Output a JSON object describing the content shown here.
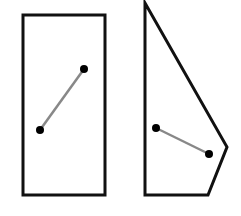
{
  "canvas": {
    "width": 241,
    "height": 216,
    "background": "#ffffff"
  },
  "colors": {
    "outline": "#111111",
    "segment": "#888888",
    "point": "#000000"
  },
  "shapes": [
    {
      "name": "rectangle",
      "type": "polygon",
      "points": [
        [
          23,
          15
        ],
        [
          105,
          15
        ],
        [
          105,
          195
        ],
        [
          23,
          195
        ]
      ],
      "stroke_width": 3,
      "segment": {
        "p1": [
          40,
          130
        ],
        "p2": [
          84,
          69
        ]
      }
    },
    {
      "name": "irregular-pentagon",
      "type": "polygon",
      "points": [
        [
          145,
          3
        ],
        [
          227,
          147
        ],
        [
          208,
          195
        ],
        [
          145,
          195
        ]
      ],
      "stroke_width": 3,
      "segment": {
        "p1": [
          156,
          128
        ],
        "p2": [
          209,
          154
        ]
      }
    }
  ],
  "point_radius": 4,
  "segment_width": 2.5
}
